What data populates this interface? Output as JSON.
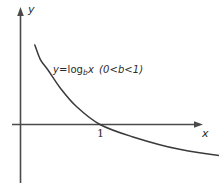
{
  "figure": {
    "axis_labels": {
      "x": "x",
      "y": "y"
    },
    "tick_labels": {
      "x_intercept": "1"
    },
    "annotation": {
      "prefix": "y",
      "equals": "=log",
      "base": "b",
      "variable": "x",
      "condition": "(0<b<1)",
      "full_text": "y=log_b x  (0<b<1)"
    },
    "colors": {
      "axis": "#4a4a4a",
      "curve": "#3a3a3a",
      "text": "#2b2b2b",
      "background": "#ffffff"
    }
  },
  "chart_data": {
    "type": "line",
    "title": "",
    "subtitle": "",
    "xlabel": "x",
    "ylabel": "y",
    "legend_position": "none",
    "grid": false,
    "xlim": [
      0,
      4.6
    ],
    "ylim": [
      -1.1,
      2.4
    ],
    "annotations": [
      {
        "text": "y=log_b x  (0<b<1)",
        "x": 1.05,
        "y": 1.35
      },
      {
        "text": "1",
        "x": 1.0,
        "y": -0.12
      }
    ],
    "series": [
      {
        "name": "y=log_b x  (0<b<1)",
        "function": "log base b of x, with 0<b<1 (decreasing)",
        "x": [
          0.18,
          0.25,
          0.35,
          0.5,
          0.7,
          1.0,
          1.4,
          2.0,
          2.8,
          3.8,
          4.5
        ],
        "values": [
          2.18,
          1.78,
          1.48,
          1.0,
          0.5,
          0.0,
          -0.33,
          -0.68,
          -0.93,
          -1.1,
          -1.2
        ]
      }
    ]
  }
}
